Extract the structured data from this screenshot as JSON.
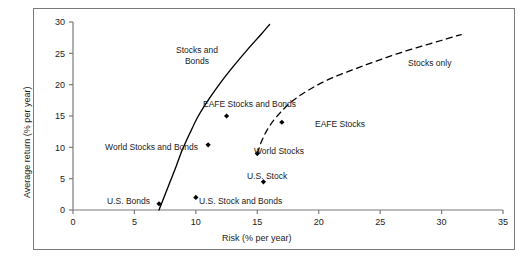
{
  "chart_data": {
    "type": "scatter",
    "title": "",
    "xlabel": "Risk (% per year)",
    "ylabel": "Average return (% per year)",
    "xlim": [
      0,
      35
    ],
    "ylim": [
      0,
      30
    ],
    "xticks": [
      0,
      5,
      10,
      15,
      20,
      25,
      30,
      35
    ],
    "yticks": [
      0,
      5,
      10,
      15,
      20,
      25,
      30
    ],
    "grid": false,
    "legend": "none",
    "points": [
      {
        "name": "U.S. Bonds",
        "x": 7.0,
        "y": 1.0,
        "label": "U.S. Bonds",
        "label_pos": "left"
      },
      {
        "name": "unlabeled-point",
        "x": 10.0,
        "y": 2.0,
        "label": "",
        "label_pos": "none"
      },
      {
        "name": "U.S. Stock and Bonds",
        "x": 15.5,
        "y": 4.5,
        "label": "U.S. Stock and Bonds",
        "label_pos": "right"
      },
      {
        "name": "World Stocks and Bonds",
        "x": 11.0,
        "y": 10.4,
        "label": "World Stocks and Bonds",
        "label_pos": "left"
      },
      {
        "name": "World Stocks",
        "x": 15.0,
        "y": 9.0,
        "label": "World Stocks",
        "label_pos": "right"
      },
      {
        "name": "EAFE Stocks and Bonds",
        "x": 12.5,
        "y": 15.0,
        "label": "EAFE Stocks and Bonds",
        "label_pos": "above"
      },
      {
        "name": "EAFE Stocks",
        "x": 17.0,
        "y": 14.0,
        "label": "EAFE Stocks",
        "label_pos": "right"
      }
    ],
    "curves": [
      {
        "name": "Stocks and Bonds",
        "style": "solid",
        "label": "Stocks and Bonds",
        "points": [
          [
            7.0,
            0.0
          ],
          [
            7.4,
            2.0
          ],
          [
            7.9,
            4.5
          ],
          [
            8.4,
            7.0
          ],
          [
            8.9,
            9.6
          ],
          [
            9.5,
            12.2
          ],
          [
            10.2,
            15.0
          ],
          [
            11.1,
            17.8
          ],
          [
            12.0,
            20.3
          ],
          [
            13.0,
            22.8
          ],
          [
            14.2,
            25.6
          ],
          [
            15.3,
            28.0
          ],
          [
            16.0,
            29.6
          ]
        ]
      },
      {
        "name": "Stocks only",
        "style": "dashed",
        "label": "Stocks only",
        "points": [
          [
            15.0,
            9.0
          ],
          [
            15.4,
            11.2
          ],
          [
            16.0,
            13.4
          ],
          [
            16.9,
            15.6
          ],
          [
            18.0,
            17.6
          ],
          [
            19.4,
            19.4
          ],
          [
            21.0,
            21.0
          ],
          [
            22.8,
            22.4
          ],
          [
            24.6,
            23.7
          ],
          [
            26.5,
            25.0
          ],
          [
            28.5,
            26.2
          ],
          [
            30.4,
            27.3
          ],
          [
            31.6,
            28.0
          ]
        ]
      }
    ],
    "curve_labels": [
      {
        "name": "stocks-and-bonds-curve-label",
        "lines": [
          "Stocks and",
          "Bonds"
        ]
      },
      {
        "name": "stocks-only-curve-label",
        "lines": [
          "Stocks only"
        ]
      }
    ],
    "colors": {
      "axis": "#7a7a7a",
      "marker": "#000000",
      "curve": "#000000",
      "text": "#1a1a1a",
      "frame": "#7a7a7a",
      "background": "#ffffff"
    }
  },
  "axis": {
    "x_title": "Risk (% per year)",
    "y_title": "Average return (% per year)",
    "x_tick_labels": [
      "0",
      "5",
      "10",
      "15",
      "20",
      "25",
      "30",
      "35"
    ],
    "y_tick_labels": [
      "0",
      "5",
      "10",
      "15",
      "20",
      "25",
      "30"
    ]
  },
  "labels": {
    "stocks_and_bonds_line1": "Stocks and",
    "stocks_and_bonds_line2": "Bonds",
    "stocks_only": "Stocks only",
    "eafe_stocks_and_bonds": "EAFE Stocks and Bonds",
    "eafe_stocks": "EAFE Stocks",
    "world_stocks_and_bonds": "World Stocks and Bonds",
    "world_stocks": "World Stocks",
    "us_stock": "U.S. Stock",
    "us_stock_and_bonds": "U.S. Stock and Bonds",
    "us_bonds": "U.S. Bonds"
  },
  "caption": {
    "text": ""
  }
}
